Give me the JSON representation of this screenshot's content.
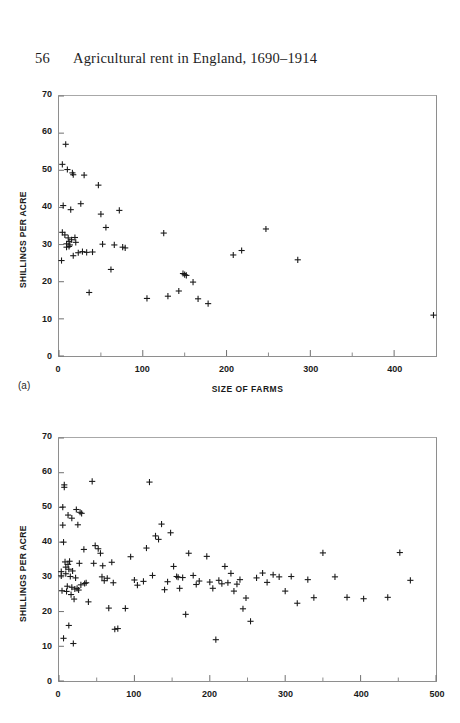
{
  "page": {
    "folio": "56",
    "running_title": "Agricultural rent in England, 1690–1914",
    "background_color": "#ffffff",
    "ink_color": "#1a1a1a"
  },
  "chart_data": [
    {
      "id": "panel-a",
      "type": "scatter",
      "panel_label": "(a)",
      "title": "",
      "xlabel": "SIZE OF FARMS",
      "ylabel": "SHILLINGS PER ACRE",
      "xlim": [
        0,
        450
      ],
      "ylim": [
        0,
        70
      ],
      "xticks": [
        0,
        100,
        200,
        300,
        400
      ],
      "xtick_labels": [
        "0",
        "100",
        "200",
        "300",
        "400"
      ],
      "xminor_ticks": [
        50,
        150,
        250,
        350
      ],
      "yticks": [
        0,
        10,
        20,
        30,
        40,
        50,
        60,
        70
      ],
      "ytick_labels": [
        "0",
        "10",
        "20",
        "30",
        "40",
        "50",
        "60",
        "70"
      ],
      "grid": false,
      "legend": null,
      "marker": "plus",
      "marker_color": "#1a1a1a",
      "points": [
        [
          8,
          57.0
        ],
        [
          4,
          51.6
        ],
        [
          5,
          40.5
        ],
        [
          4,
          33.3
        ],
        [
          3,
          25.7
        ],
        [
          7,
          32.6
        ],
        [
          9,
          30.2
        ],
        [
          9,
          29.3
        ],
        [
          10,
          50.2
        ],
        [
          11,
          31.8
        ],
        [
          12,
          30.8
        ],
        [
          12,
          29.5
        ],
        [
          13,
          29.9
        ],
        [
          14,
          39.4
        ],
        [
          15,
          31.3
        ],
        [
          16,
          49.3
        ],
        [
          17,
          48.8
        ],
        [
          17,
          27.0
        ],
        [
          19,
          31.9
        ],
        [
          20,
          30.6
        ],
        [
          23,
          27.8
        ],
        [
          26,
          41.0
        ],
        [
          28,
          28.1
        ],
        [
          30,
          48.7
        ],
        [
          33,
          27.9
        ],
        [
          36,
          17.1
        ],
        [
          40,
          28.0
        ],
        [
          47,
          46.0
        ],
        [
          50,
          38.2
        ],
        [
          52,
          30.1
        ],
        [
          56,
          34.6
        ],
        [
          62,
          23.3
        ],
        [
          66,
          29.9
        ],
        [
          72,
          39.2
        ],
        [
          76,
          29.3
        ],
        [
          79,
          29.1
        ],
        [
          105,
          15.5
        ],
        [
          125,
          33.1
        ],
        [
          130,
          16.1
        ],
        [
          143,
          17.5
        ],
        [
          148,
          22.2
        ],
        [
          150,
          21.9
        ],
        [
          152,
          21.7
        ],
        [
          160,
          19.9
        ],
        [
          166,
          15.4
        ],
        [
          178,
          14.1
        ],
        [
          208,
          27.2
        ],
        [
          218,
          28.4
        ],
        [
          247,
          34.2
        ],
        [
          285,
          25.9
        ],
        [
          447,
          11.0
        ]
      ]
    },
    {
      "id": "panel-b",
      "type": "scatter",
      "panel_label": "",
      "title": "",
      "xlabel": "",
      "ylabel": "SHILLINGS PER ACRE",
      "xlim": [
        0,
        500
      ],
      "ylim": [
        0,
        70
      ],
      "xticks": [
        0,
        100,
        200,
        300,
        400,
        500
      ],
      "xtick_labels": [
        "0",
        "100",
        "200",
        "300",
        "400",
        "500"
      ],
      "xminor_ticks": [
        50,
        150,
        250,
        350,
        450
      ],
      "yticks": [
        0,
        10,
        20,
        30,
        40,
        50,
        60,
        70
      ],
      "ytick_labels": [
        "0",
        "10",
        "20",
        "30",
        "40",
        "50",
        "60",
        "70"
      ],
      "grid": false,
      "legend": null,
      "marker": "plus",
      "marker_color": "#1a1a1a",
      "points": [
        [
          3,
          31.5
        ],
        [
          3,
          30.3
        ],
        [
          4,
          26.0
        ],
        [
          5,
          50.1
        ],
        [
          5,
          44.9
        ],
        [
          6,
          40.0
        ],
        [
          6,
          12.3
        ],
        [
          7,
          56.5
        ],
        [
          7,
          55.8
        ],
        [
          8,
          34.3
        ],
        [
          9,
          32.8
        ],
        [
          9,
          30.9
        ],
        [
          10,
          25.8
        ],
        [
          11,
          27.3
        ],
        [
          12,
          47.8
        ],
        [
          12,
          33.6
        ],
        [
          13,
          32.2
        ],
        [
          13,
          16.0
        ],
        [
          14,
          34.5
        ],
        [
          15,
          30.1
        ],
        [
          16,
          24.9
        ],
        [
          17,
          46.9
        ],
        [
          17,
          27.0
        ],
        [
          18,
          31.7
        ],
        [
          19,
          10.8
        ],
        [
          20,
          23.6
        ],
        [
          21,
          26.5
        ],
        [
          22,
          29.7
        ],
        [
          23,
          49.4
        ],
        [
          24,
          26.7
        ],
        [
          25,
          45.0
        ],
        [
          26,
          26.2
        ],
        [
          27,
          33.9
        ],
        [
          28,
          48.6
        ],
        [
          29,
          27.7
        ],
        [
          30,
          48.3
        ],
        [
          33,
          37.9
        ],
        [
          34,
          28.1
        ],
        [
          36,
          28.3
        ],
        [
          39,
          22.8
        ],
        [
          44,
          57.5
        ],
        [
          46,
          33.9
        ],
        [
          48,
          39.0
        ],
        [
          52,
          38.1
        ],
        [
          55,
          36.8
        ],
        [
          57,
          30.0
        ],
        [
          58,
          33.2
        ],
        [
          60,
          28.9
        ],
        [
          64,
          29.6
        ],
        [
          66,
          21.0
        ],
        [
          70,
          34.2
        ],
        [
          72,
          28.3
        ],
        [
          74,
          14.9
        ],
        [
          78,
          15.1
        ],
        [
          88,
          20.9
        ],
        [
          95,
          35.8
        ],
        [
          100,
          29.1
        ],
        [
          104,
          27.6
        ],
        [
          112,
          28.7
        ],
        [
          116,
          38.3
        ],
        [
          120,
          57.3
        ],
        [
          124,
          30.4
        ],
        [
          128,
          41.8
        ],
        [
          132,
          40.8
        ],
        [
          136,
          45.2
        ],
        [
          140,
          26.3
        ],
        [
          144,
          28.6
        ],
        [
          148,
          42.7
        ],
        [
          152,
          33.0
        ],
        [
          156,
          30.1
        ],
        [
          158,
          29.9
        ],
        [
          160,
          26.7
        ],
        [
          164,
          29.8
        ],
        [
          168,
          19.2
        ],
        [
          172,
          36.8
        ],
        [
          178,
          30.4
        ],
        [
          182,
          27.8
        ],
        [
          186,
          28.8
        ],
        [
          196,
          35.9
        ],
        [
          200,
          28.5
        ],
        [
          204,
          26.7
        ],
        [
          208,
          11.9
        ],
        [
          212,
          29.0
        ],
        [
          216,
          28.0
        ],
        [
          220,
          33.0
        ],
        [
          224,
          28.3
        ],
        [
          228,
          31.0
        ],
        [
          232,
          25.9
        ],
        [
          236,
          27.9
        ],
        [
          240,
          29.2
        ],
        [
          244,
          20.8
        ],
        [
          248,
          23.9
        ],
        [
          254,
          17.2
        ],
        [
          262,
          29.7
        ],
        [
          270,
          31.1
        ],
        [
          276,
          28.4
        ],
        [
          284,
          30.6
        ],
        [
          292,
          30.0
        ],
        [
          300,
          25.9
        ],
        [
          308,
          30.1
        ],
        [
          316,
          22.4
        ],
        [
          330,
          29.2
        ],
        [
          338,
          24.0
        ],
        [
          350,
          36.9
        ],
        [
          366,
          30.0
        ],
        [
          382,
          24.1
        ],
        [
          404,
          23.7
        ],
        [
          436,
          24.1
        ],
        [
          452,
          37.0
        ],
        [
          466,
          29.0
        ]
      ]
    }
  ]
}
